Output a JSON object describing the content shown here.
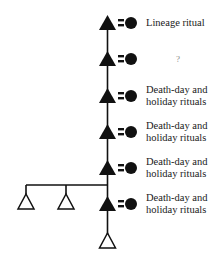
{
  "diagram": {
    "type": "kinship-lineage",
    "colors": {
      "ink": "#111111",
      "background": "#ffffff"
    },
    "generations": [
      {
        "index": 1,
        "male": "filled-triangle",
        "female": "filled-circle",
        "marriage": "=",
        "label": "Lineage ritual",
        "lines": [
          "Lineage ritual"
        ]
      },
      {
        "index": 2,
        "male": "filled-triangle",
        "female": "filled-circle",
        "marriage": "=",
        "label": "?",
        "lines": [
          "?"
        ]
      },
      {
        "index": 3,
        "male": "filled-triangle",
        "female": "filled-circle",
        "marriage": "=",
        "label": "Death-day and holiday rituals",
        "lines": [
          "Death-day and",
          "holiday rituals"
        ]
      },
      {
        "index": 4,
        "male": "filled-triangle",
        "female": "filled-circle",
        "marriage": "=",
        "label": "Death-day and holiday rituals",
        "lines": [
          "Death-day and",
          "holiday rituals"
        ]
      },
      {
        "index": 5,
        "male": "filled-triangle",
        "female": "filled-circle",
        "marriage": "=",
        "label": "Death-day and holiday rituals",
        "lines": [
          "Death-day and",
          "holiday rituals"
        ]
      },
      {
        "index": 6,
        "male": "filled-triangle",
        "female": "filled-circle",
        "marriage": "=",
        "label": "Death-day and holiday rituals",
        "lines": [
          "Death-day and",
          "holiday rituals"
        ]
      }
    ],
    "siblings_of_gen6": [
      {
        "symbol": "open-triangle"
      },
      {
        "symbol": "open-triangle"
      }
    ],
    "descendant": {
      "symbol": "open-triangle"
    }
  }
}
